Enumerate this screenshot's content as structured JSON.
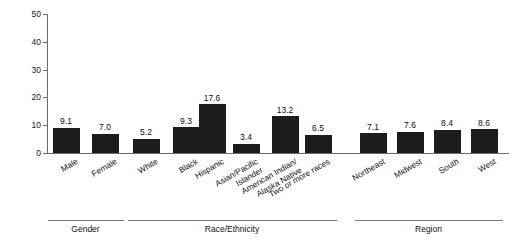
{
  "chart_data": {
    "type": "bar",
    "title": "",
    "subtitle": "",
    "xlabel": "",
    "ylabel": "Percent",
    "ylim": [
      0,
      50
    ],
    "yticks": [
      0,
      10,
      20,
      30,
      40,
      50
    ],
    "ytick_labels": [
      "0",
      "10",
      "20",
      "30",
      "40",
      "50"
    ],
    "grid": false,
    "legend": "none",
    "orientation": "vertical",
    "bar_color": "#1c1c1c",
    "axis_color": "#6b6b6b",
    "categories": [
      "Male",
      "Female",
      "White",
      "Black",
      "Hispanic",
      "Asian/Pacific Islander",
      "American Indian/ Alaska Native",
      "Two or more races",
      "Northeast",
      "Midwest",
      "South",
      "West"
    ],
    "values": [
      9.1,
      7.0,
      5.2,
      9.3,
      17.6,
      3.4,
      13.2,
      6.5,
      7.1,
      7.6,
      8.4,
      8.6
    ],
    "data_labels": [
      "9.1",
      "7.0",
      "5.2",
      "9.3",
      "17.6",
      "3.4",
      "13.2",
      "6.5",
      "7.1",
      "7.6",
      "8.4",
      "8.6"
    ],
    "category_lines": [
      [
        "Male"
      ],
      [
        "Female"
      ],
      [
        "White"
      ],
      [
        "Black"
      ],
      [
        "Hispanic"
      ],
      [
        "Asian/Pacific",
        "Islander"
      ],
      [
        "American Indian/",
        "Alaska Native"
      ],
      [
        "Two or more races"
      ],
      [
        "Northeast"
      ],
      [
        "Midwest"
      ],
      [
        "South"
      ],
      [
        "West"
      ]
    ],
    "groups": [
      {
        "label": "Gender",
        "start_index": 0,
        "end_index": 1
      },
      {
        "label": "Race/Ethnicity",
        "start_index": 2,
        "end_index": 7
      },
      {
        "label": "Region",
        "start_index": 8,
        "end_index": 11
      }
    ]
  }
}
